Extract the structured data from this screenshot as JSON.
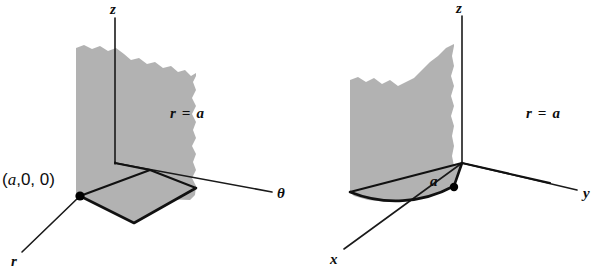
{
  "figure": {
    "caption": "",
    "background_color": "#ffffff",
    "surface_color": "#b2b2b2",
    "line_color": "#111111",
    "text_color": "#0d0d0d"
  },
  "diagrams": [
    {
      "id": "cylindrical-coordinates-plane",
      "coordinate_system": "cylindrical",
      "surface_label": "r = a",
      "surface_label_parts": {
        "variable": "r",
        "equals": "=",
        "value": "a"
      },
      "point_label": "(a,0,0)",
      "point_label_parts": {
        "open": "(",
        "a": "a",
        "rest": ",0, 0)"
      },
      "axes": [
        {
          "name": "z-axis",
          "label": "z",
          "direction": "up"
        },
        {
          "name": "theta-axis",
          "label": "θ",
          "direction": "right"
        },
        {
          "name": "r-axis",
          "label": "r",
          "direction": "lower-left"
        }
      ]
    },
    {
      "id": "cartesian-cylinder-sector",
      "coordinate_system": "cartesian",
      "surface_label": "r = a",
      "surface_label_parts": {
        "variable": "r",
        "equals": "=",
        "value": "a"
      },
      "radius_label": "a",
      "axes": [
        {
          "name": "z-axis",
          "label": "z",
          "direction": "up"
        },
        {
          "name": "y-axis",
          "label": "y",
          "direction": "right"
        },
        {
          "name": "x-axis",
          "label": "x",
          "direction": "lower-left"
        }
      ]
    }
  ]
}
